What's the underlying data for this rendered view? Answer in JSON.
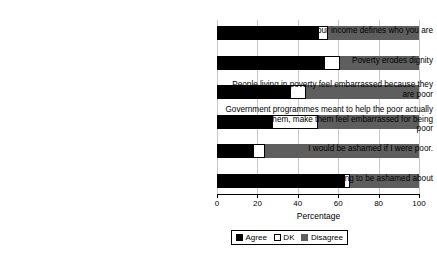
{
  "chart_data": {
    "type": "bar",
    "orientation": "horizontal",
    "stacked": true,
    "title": "",
    "xlabel": "Percentage",
    "ylabel": "",
    "xlim": [
      0,
      100
    ],
    "xticks": [
      0,
      20,
      40,
      60,
      80,
      100
    ],
    "xtick_labels": [
      "0",
      "20",
      "40",
      "60",
      "80",
      "100"
    ],
    "grid": true,
    "grid_axis": "x",
    "legend_position": "bottom",
    "categories": [
      "Your income defines who you are",
      "Poverty erodes dignity",
      "People living in poverty feel embarrassed because they are poor",
      "Government programmes meant to help the poor actually stigmatize them, make them feel embarrassed for being poor",
      "I would be ashamed if I were poor.",
      "Being poor is nothing to be ashamed about"
    ],
    "series": [
      {
        "name": "Agree",
        "color": "#000000",
        "values": [
          50,
          53,
          36,
          27,
          18,
          63
        ]
      },
      {
        "name": "DK",
        "color": "#ffffff",
        "values": [
          5,
          8,
          8,
          23,
          6,
          3
        ]
      },
      {
        "name": "Disagree",
        "color": "#5e5e5e",
        "values": [
          45,
          39,
          56,
          50,
          76,
          34
        ]
      }
    ]
  },
  "legend": {
    "items": [
      {
        "label": "Agree"
      },
      {
        "label": "DK"
      },
      {
        "label": "Disagree"
      }
    ]
  }
}
